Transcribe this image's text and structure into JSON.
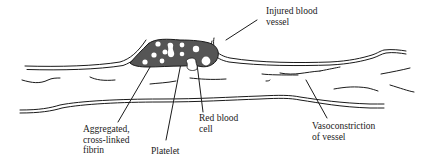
{
  "diagram": {
    "colors": {
      "line": "#1a1a1a",
      "clot_fill": "#555555",
      "background": "#ffffff"
    },
    "labels": {
      "injured_vessel": {
        "line1": "Injured blood",
        "line2": "vessel"
      },
      "fibrin": {
        "line1": "Aggregated,",
        "line2": "cross-linked",
        "line3": "fibrin"
      },
      "platelet": {
        "line1": "Platelet"
      },
      "red_blood_cell": {
        "line1": "Red blood",
        "line2": "cell"
      },
      "vasoconstriction": {
        "line1": "Vasoconstriction",
        "line2": "of vessel"
      }
    }
  }
}
